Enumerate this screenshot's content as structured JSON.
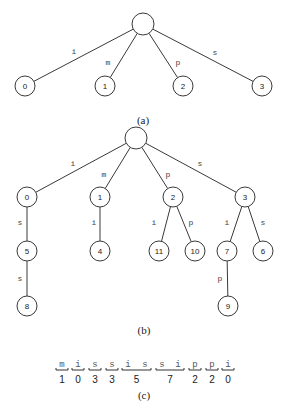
{
  "figure_a": {
    "caption": "(a)",
    "root": {
      "x": 143,
      "y": 24
    },
    "nodes": [
      {
        "id": "0",
        "label": "0",
        "x": 25,
        "y": 86,
        "edge": "i",
        "ex": 74,
        "ey": 51
      },
      {
        "id": "1",
        "label": "1",
        "x": 105,
        "y": 86,
        "edge": "m",
        "ex": 108,
        "ey": 62
      },
      {
        "id": "2",
        "label": "2",
        "x": 183,
        "y": 86,
        "edge": "p",
        "ex": 178,
        "ey": 62
      },
      {
        "id": "3",
        "label": "3",
        "x": 262,
        "y": 86,
        "edge": "s",
        "ex": 215,
        "ey": 52
      }
    ],
    "caption_pos": {
      "x": 143,
      "y": 120
    }
  },
  "figure_b": {
    "caption": "(b)",
    "root": {
      "x": 136,
      "y": 138
    },
    "nodes": [
      {
        "id": "0",
        "label": "0",
        "x": 27,
        "y": 197,
        "parent": "root",
        "edge": "i",
        "ex": 73,
        "ey": 163
      },
      {
        "id": "1",
        "label": "1",
        "x": 100,
        "y": 197,
        "parent": "root",
        "edge": "m",
        "ex": 104,
        "ey": 174
      },
      {
        "id": "2",
        "label": "2",
        "x": 173,
        "y": 197,
        "parent": "root",
        "edge": "p",
        "ex": 168,
        "ey": 174
      },
      {
        "id": "3",
        "label": "3",
        "x": 245,
        "y": 197,
        "parent": "root",
        "edge": "s",
        "ex": 200,
        "ey": 163
      },
      {
        "id": "5",
        "label": "5",
        "x": 27,
        "y": 251,
        "parent": "0",
        "edge": "s",
        "ex": 20,
        "ey": 222
      },
      {
        "id": "4",
        "label": "4",
        "x": 100,
        "y": 251,
        "parent": "1",
        "edge": "i",
        "ex": 94,
        "ey": 222
      },
      {
        "id": "11",
        "label": "11",
        "x": 159,
        "y": 251,
        "parent": "2",
        "edge": "i",
        "ex": 154,
        "ey": 222
      },
      {
        "id": "10",
        "label": "10",
        "x": 195,
        "y": 251,
        "parent": "2",
        "edge": "p",
        "ex": 191,
        "ey": 222
      },
      {
        "id": "7",
        "label": "7",
        "x": 227,
        "y": 251,
        "parent": "3",
        "edge": "i",
        "ex": 227,
        "ey": 222
      },
      {
        "id": "6",
        "label": "6",
        "x": 263,
        "y": 251,
        "parent": "3",
        "edge": "s",
        "ex": 263,
        "ey": 222
      },
      {
        "id": "8",
        "label": "8",
        "x": 27,
        "y": 306,
        "parent": "5",
        "edge": "s",
        "ex": 20,
        "ey": 278
      },
      {
        "id": "9",
        "label": "9",
        "x": 228,
        "y": 306,
        "parent": "7",
        "edge": "p",
        "ex": 220,
        "ey": 278
      }
    ],
    "caption_pos": {
      "x": 144,
      "y": 330
    }
  },
  "figure_c": {
    "caption": "(c)",
    "caption_pos": {
      "x": 144,
      "y": 395
    },
    "characters": [
      "m",
      "i",
      "s",
      "s",
      "i",
      "s",
      "s",
      "i",
      "p",
      "p",
      "i"
    ],
    "char_x": [
      62,
      78,
      95,
      112,
      128,
      145,
      162,
      178,
      195,
      212,
      228
    ],
    "char_y": 365,
    "groups": [
      {
        "start": 0,
        "end": 0,
        "value": "1"
      },
      {
        "start": 1,
        "end": 1,
        "value": "0"
      },
      {
        "start": 2,
        "end": 2,
        "value": "3"
      },
      {
        "start": 3,
        "end": 3,
        "value": "3"
      },
      {
        "start": 4,
        "end": 5,
        "value": "5"
      },
      {
        "start": 6,
        "end": 7,
        "value": "7"
      },
      {
        "start": 8,
        "end": 8,
        "value": "2"
      },
      {
        "start": 9,
        "end": 9,
        "value": "2"
      },
      {
        "start": 10,
        "end": 10,
        "value": "0"
      }
    ],
    "bracket_y": 370,
    "num_y": 379
  },
  "style": {
    "node_radius": 10,
    "root_radius": 11,
    "stroke_color": "#3a3a3a"
  }
}
